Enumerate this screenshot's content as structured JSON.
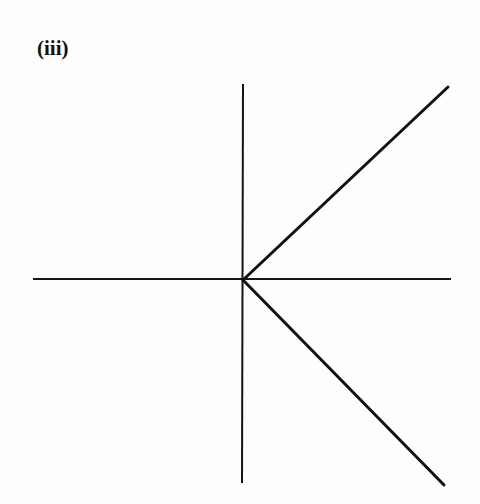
{
  "figure": {
    "label": "(iii)",
    "axes": {
      "origin": [
        243,
        280
      ],
      "x_axis": {
        "from": [
          33,
          279
        ],
        "to": [
          451,
          279
        ]
      },
      "y_axis": {
        "from": [
          243,
          84
        ],
        "to": [
          242,
          483
        ]
      }
    },
    "rays": [
      {
        "name": "upper-ray",
        "from": [
          243,
          280
        ],
        "to": [
          448,
          87
        ]
      },
      {
        "name": "lower-ray",
        "from": [
          243,
          280
        ],
        "to": [
          444,
          485
        ]
      }
    ],
    "stroke_color": "#111111"
  }
}
